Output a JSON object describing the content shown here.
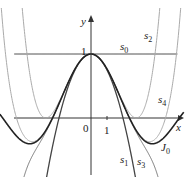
{
  "chart_data": {
    "type": "line",
    "title": "",
    "xlabel": "x",
    "ylabel": "y",
    "x_ticks": [
      "0",
      "1"
    ],
    "y_ticks": [
      "1"
    ],
    "xlim": [
      -5.7,
      5.8
    ],
    "ylim": [
      -1.05,
      1.35
    ],
    "grid": false,
    "legend": "inline curve labels",
    "series": [
      {
        "name": "s0",
        "label": "s_0",
        "formula": "1",
        "color": "#333333"
      },
      {
        "name": "s1",
        "label": "s_1",
        "formula": "1 - x^2/4",
        "color": "#444444"
      },
      {
        "name": "s2",
        "label": "s_2",
        "formula": "1 - x^2/4 + x^4/64",
        "color": "#aaaaaa"
      },
      {
        "name": "s3",
        "label": "s_3",
        "formula": "1 - x^2/4 + x^4/64 - x^6/2304",
        "color": "#777777"
      },
      {
        "name": "s4",
        "label": "s_4",
        "formula": "1 - x^2/4 + x^4/64 - x^6/2304 + x^8/147456",
        "color": "#aaaaaa"
      },
      {
        "name": "J0",
        "label": "J_0",
        "formula": "Bessel J0(x)",
        "color": "#222222"
      }
    ]
  },
  "labels": {
    "x_axis": "x",
    "y_axis": "y",
    "origin": "0",
    "x_tick_1": "1",
    "y_tick_1": "1",
    "s0": "s",
    "s0_sub": "0",
    "s1": "s",
    "s1_sub": "1",
    "s2": "s",
    "s2_sub": "2",
    "s3": "s",
    "s3_sub": "3",
    "s4": "s",
    "s4_sub": "4",
    "J0": "J",
    "J0_sub": "0"
  }
}
